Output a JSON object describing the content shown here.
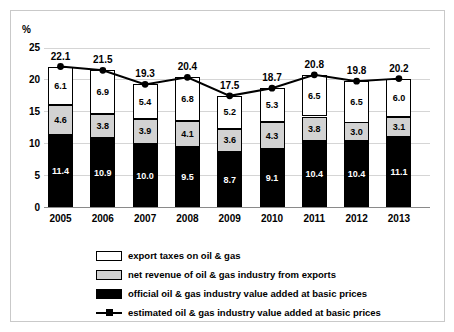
{
  "chart_data": {
    "type": "bar",
    "title": "",
    "subtitle": "",
    "xlabel": "",
    "ylabel": "%",
    "ylim": [
      0,
      25
    ],
    "yticks": [
      "0",
      "5",
      "10",
      "15",
      "20",
      "25"
    ],
    "grid": true,
    "legend_position": "bottom",
    "stacked": true,
    "categories": [
      "2005",
      "2006",
      "2007",
      "2008",
      "2009",
      "2010",
      "2011",
      "2012",
      "2013"
    ],
    "series": [
      {
        "name": "official oil & gas industry value added at basic prices",
        "style": "black",
        "values": [
          11.4,
          10.9,
          10.0,
          9.5,
          8.7,
          9.1,
          10.4,
          10.4,
          11.1
        ]
      },
      {
        "name": "net revenue of oil & gas industry from exports",
        "style": "gray",
        "values": [
          4.6,
          3.8,
          3.9,
          4.1,
          3.6,
          4.3,
          3.8,
          3.0,
          3.1
        ]
      },
      {
        "name": "export taxes on oil & gas",
        "style": "white",
        "values": [
          6.1,
          6.9,
          5.4,
          6.8,
          5.2,
          5.3,
          6.5,
          6.5,
          6.0
        ]
      },
      {
        "name": "estimated oil & gas industry value added at basic prices",
        "style": "line",
        "values": [
          22.1,
          21.5,
          19.3,
          20.4,
          17.5,
          18.7,
          20.8,
          19.8,
          20.2
        ]
      }
    ],
    "totals": [
      22.1,
      21.5,
      19.3,
      20.4,
      17.5,
      18.7,
      20.8,
      19.8,
      20.2
    ]
  },
  "axis": {
    "y_unit_label": "%",
    "y_ticks": [
      "25",
      "20",
      "15",
      "10",
      "5",
      "0"
    ]
  },
  "legend": {
    "items": [
      {
        "label": "export taxes on oil & gas",
        "key": "white-swatch"
      },
      {
        "label": "net revenue of oil & gas industry from exports",
        "key": "gray-swatch"
      },
      {
        "label": "official oil & gas industry value added at basic prices",
        "key": "black-swatch"
      },
      {
        "label": "estimated oil & gas industry value added at basic prices",
        "key": "line-marker"
      }
    ]
  },
  "colors": {
    "black": "#000000",
    "gray": "#d2d2d2",
    "white": "#ffffff",
    "grid": "#d5d5d5",
    "frame": "#c9c9c9"
  }
}
